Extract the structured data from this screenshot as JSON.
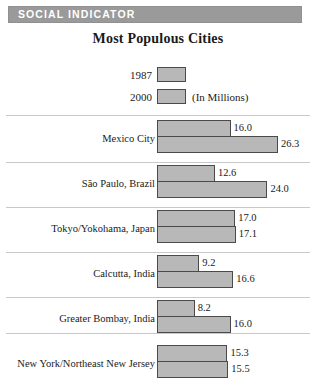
{
  "header": {
    "band_label": "SOCIAL INDICATOR",
    "band_color": "#9a9a9a"
  },
  "chart_data": {
    "type": "bar",
    "orientation": "horizontal",
    "title": "Most Populous Cities",
    "xlabel": "",
    "ylabel": "",
    "unit_note": "(In Millions)",
    "legend": [
      {
        "label": "1987",
        "note": ""
      },
      {
        "label": "2000",
        "note": "(In Millions)"
      }
    ],
    "legend_position": "top",
    "grid": false,
    "categories": [
      "Mexico City",
      "São Paulo, Brazil",
      "Tokyo/Yokohama, Japan",
      "Calcutta, India",
      "Greater Bombay, India",
      "New York/Northeast New Jersey"
    ],
    "series": [
      {
        "name": "1987",
        "values": [
          16.0,
          12.6,
          17.0,
          9.2,
          8.2,
          15.3
        ]
      },
      {
        "name": "2000",
        "values": [
          26.3,
          24.0,
          17.1,
          16.6,
          16.0,
          15.5
        ]
      }
    ],
    "value_labels": [
      {
        "category": "Mexico City",
        "v1987": "16.0",
        "v2000": "26.3"
      },
      {
        "category": "São Paulo, Brazil",
        "v1987": "12.6",
        "v2000": "24.0"
      },
      {
        "category": "Tokyo/Yokohama, Japan",
        "v1987": "17.0",
        "v2000": "17.1"
      },
      {
        "category": "Calcutta, India",
        "v1987": "9.2",
        "v2000": "16.6"
      },
      {
        "category": "Greater Bombay, India",
        "v1987": "8.2",
        "v2000": "16.0"
      },
      {
        "category": "New York/Northeast New Jersey",
        "v1987": "15.3",
        "v2000": "15.5"
      }
    ],
    "xlim": [
      0,
      26.3
    ],
    "bar_fill_color": "#b8b8b8",
    "bar_edge_color": "#4a4a4a",
    "px_per_unit": 4.6
  }
}
